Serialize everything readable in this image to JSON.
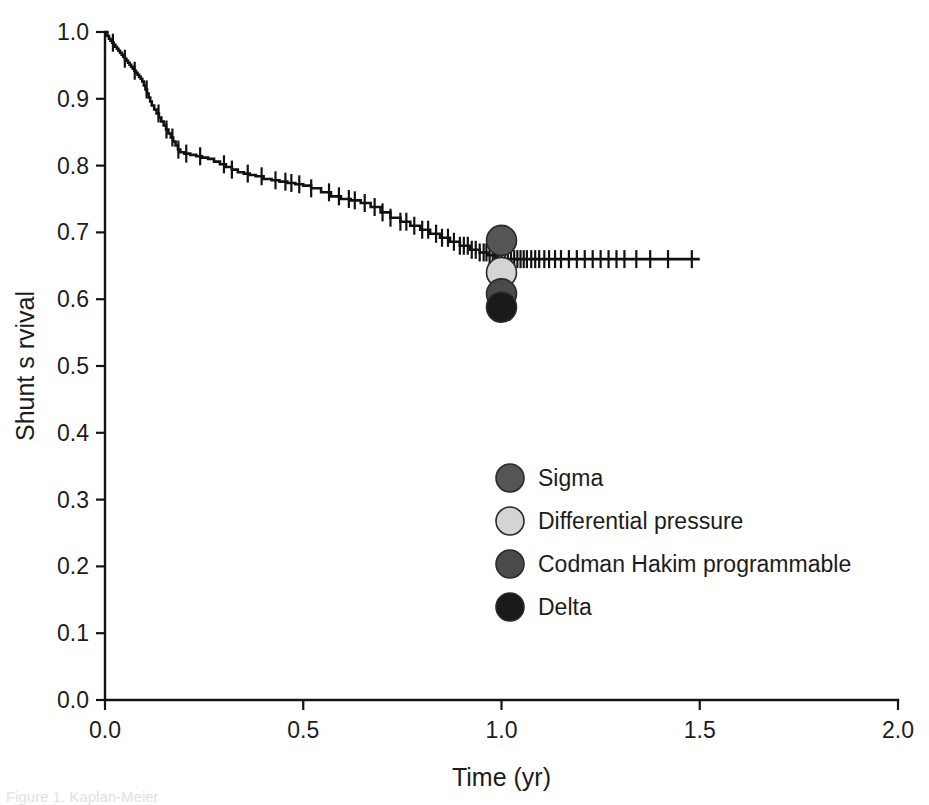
{
  "figure": {
    "background_color": "#ffffff",
    "caption_partial": "Figure 1. Kaplan-Meier"
  },
  "chart_data": {
    "type": "line",
    "subtype": "kaplan-meier-survival",
    "title": "",
    "subtitle": "",
    "xlabel": "Time (yr)",
    "ylabel": "Shunt s rvival",
    "xlim": [
      0.0,
      2.0
    ],
    "ylim": [
      0.0,
      1.0
    ],
    "grid": false,
    "legend_position": "center-right-inside",
    "xticks": [
      0.0,
      0.5,
      1.0,
      1.5,
      2.0
    ],
    "xtick_labels": [
      "0.0",
      "0.5",
      "1.0",
      "1.5",
      "2.0"
    ],
    "yticks": [
      0.0,
      0.1,
      0.2,
      0.3,
      0.4,
      0.5,
      0.6,
      0.7,
      0.8,
      0.9,
      1.0
    ],
    "ytick_labels": [
      "0.0",
      "0.1",
      "0.2",
      "0.3",
      "0.4",
      "0.5",
      "0.6",
      "0.7",
      "0.8",
      "0.9",
      "1.0"
    ],
    "series": [
      {
        "name": "Overall shunt survival",
        "type": "step",
        "color": "#111111",
        "x": [
          0.0,
          0.006,
          0.01,
          0.014,
          0.018,
          0.022,
          0.026,
          0.03,
          0.034,
          0.038,
          0.042,
          0.046,
          0.05,
          0.054,
          0.058,
          0.062,
          0.066,
          0.07,
          0.074,
          0.078,
          0.082,
          0.086,
          0.09,
          0.094,
          0.098,
          0.102,
          0.106,
          0.11,
          0.114,
          0.118,
          0.124,
          0.13,
          0.136,
          0.142,
          0.148,
          0.154,
          0.16,
          0.166,
          0.172,
          0.178,
          0.184,
          0.19,
          0.2,
          0.215,
          0.23,
          0.245,
          0.26,
          0.275,
          0.29,
          0.305,
          0.32,
          0.335,
          0.35,
          0.365,
          0.38,
          0.4,
          0.42,
          0.44,
          0.46,
          0.48,
          0.5,
          0.52,
          0.545,
          0.57,
          0.595,
          0.62,
          0.645,
          0.67,
          0.695,
          0.72,
          0.745,
          0.77,
          0.795,
          0.82,
          0.845,
          0.87,
          0.895,
          0.92,
          0.945,
          0.965,
          0.985,
          1.0,
          1.5
        ],
        "y": [
          1.0,
          0.994,
          0.99,
          0.987,
          0.984,
          0.981,
          0.978,
          0.975,
          0.972,
          0.969,
          0.966,
          0.963,
          0.96,
          0.957,
          0.954,
          0.951,
          0.948,
          0.945,
          0.942,
          0.939,
          0.936,
          0.933,
          0.93,
          0.926,
          0.92,
          0.914,
          0.908,
          0.902,
          0.896,
          0.89,
          0.884,
          0.878,
          0.872,
          0.866,
          0.86,
          0.854,
          0.848,
          0.842,
          0.836,
          0.83,
          0.824,
          0.82,
          0.818,
          0.816,
          0.814,
          0.812,
          0.81,
          0.806,
          0.802,
          0.798,
          0.794,
          0.79,
          0.788,
          0.786,
          0.784,
          0.78,
          0.778,
          0.776,
          0.774,
          0.772,
          0.77,
          0.766,
          0.76,
          0.754,
          0.75,
          0.748,
          0.744,
          0.738,
          0.73,
          0.722,
          0.716,
          0.71,
          0.704,
          0.698,
          0.692,
          0.686,
          0.68,
          0.674,
          0.67,
          0.666,
          0.662,
          0.66,
          0.66
        ],
        "censored_x": [
          0.02,
          0.05,
          0.075,
          0.105,
          0.135,
          0.155,
          0.17,
          0.185,
          0.205,
          0.24,
          0.3,
          0.32,
          0.36,
          0.395,
          0.43,
          0.455,
          0.47,
          0.49,
          0.52,
          0.565,
          0.59,
          0.615,
          0.63,
          0.655,
          0.68,
          0.7,
          0.72,
          0.745,
          0.76,
          0.78,
          0.8,
          0.815,
          0.835,
          0.85,
          0.865,
          0.88,
          0.895,
          0.905,
          0.915,
          0.925,
          0.935,
          0.945,
          0.955,
          0.962,
          0.97,
          0.978,
          0.985,
          0.992,
          1.0,
          1.008,
          1.016,
          1.024,
          1.032,
          1.04,
          1.048,
          1.056,
          1.064,
          1.075,
          1.085,
          1.095,
          1.108,
          1.12,
          1.135,
          1.15,
          1.17,
          1.19,
          1.21,
          1.23,
          1.25,
          1.27,
          1.29,
          1.31,
          1.34,
          1.375,
          1.42,
          1.48
        ]
      }
    ],
    "point_markers": [
      {
        "label": "Sigma",
        "x": 1.0,
        "y": 0.688,
        "color": "#555555",
        "edge_color": "#2a2a2a",
        "radius_px": 15
      },
      {
        "label": "Differential pressure",
        "x": 1.0,
        "y": 0.64,
        "color": "#d4d4d4",
        "edge_color": "#7a7a7a",
        "radius_px": 15
      },
      {
        "label": "Codman Hakim programmable",
        "x": 1.0,
        "y": 0.608,
        "color": "#4a4a4a",
        "edge_color": "#2a2a2a",
        "radius_px": 15
      },
      {
        "label": "Delta",
        "x": 1.0,
        "y": 0.588,
        "color": "#1a1a1a",
        "edge_color": "#111111",
        "radius_px": 15
      }
    ],
    "legend": [
      {
        "label": "Sigma",
        "color": "#555555",
        "edge_color": "#2a2a2a"
      },
      {
        "label": "Differential pressure",
        "color": "#d4d4d4",
        "edge_color": "#7a7a7a"
      },
      {
        "label": "Codman Hakim programmable",
        "color": "#4a4a4a",
        "edge_color": "#2a2a2a"
      },
      {
        "label": "Delta",
        "color": "#1a1a1a",
        "edge_color": "#111111"
      }
    ]
  }
}
